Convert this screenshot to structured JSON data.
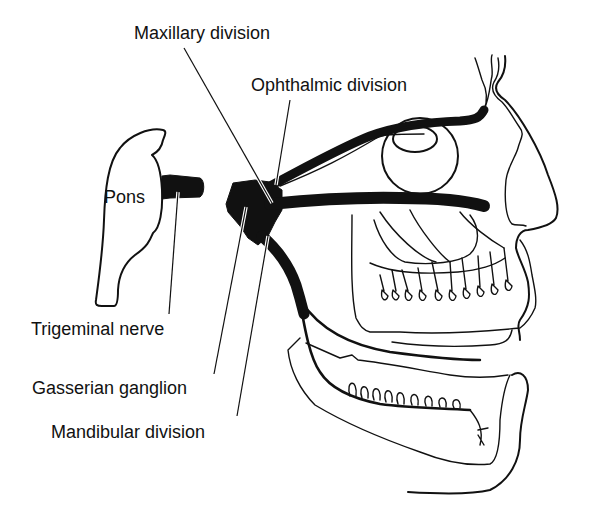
{
  "diagram": {
    "labels": {
      "maxillary": "Maxillary division",
      "ophthalmic": "Ophthalmic division",
      "pons": "Pons",
      "trigeminal": "Trigeminal nerve",
      "gasserian": "Gasserian ganglion",
      "mandibular": "Mandibular division"
    },
    "colors": {
      "ink": "#111111",
      "background": "#ffffff"
    }
  }
}
